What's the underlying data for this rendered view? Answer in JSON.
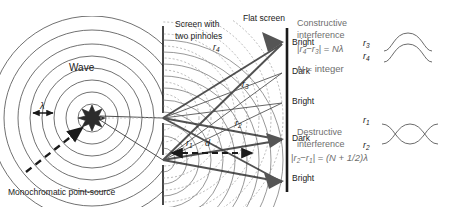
{
  "figure": {
    "type": "physics-diagram",
    "topic": "Young's double-slit (two-pinhole) interference",
    "background_color": "#ffffff",
    "ink_color": "#1a1a1a",
    "gray_color": "#6e6e6e"
  },
  "labels": {
    "screen_with_pinholes_line1": "Screen with",
    "screen_with_pinholes_line2": "two pinholes",
    "flat_screen": "Flat screen",
    "wave": "Wave",
    "source": "Monochromatic point-source",
    "wavelength_symbol": "λ",
    "slit_separation_symbol": "d"
  },
  "ray_labels": {
    "r4": "r",
    "r4_sub": "4",
    "r3": "r",
    "r3_sub": "3",
    "r2": "r",
    "r2_sub": "2",
    "r1": "r",
    "r1_sub": "1"
  },
  "fringes": [
    {
      "label": "Bright",
      "y": 44
    },
    {
      "label": "Dark",
      "y": 73
    },
    {
      "label": "Bright",
      "y": 103
    },
    {
      "label": "Dark",
      "y": 140
    },
    {
      "label": "Bright",
      "y": 180
    }
  ],
  "constructive": {
    "title_line1": "Constructive",
    "title_line2": "interference",
    "formula": "|r₄ − r₃| = Nλ",
    "formula_parts": {
      "bar_open": "|",
      "r_first": "r",
      "r_first_sub": "4",
      "minus": "−",
      "r_second": "r",
      "r_second_sub": "3",
      "bar_close": "|",
      "equals": "=",
      "rhs": "Nλ"
    },
    "note": "N = integer",
    "note_parts": {
      "n": "N",
      "eq": "=",
      "word": "integer"
    },
    "wave_top_label": "r",
    "wave_top_sub": "3",
    "wave_bottom_label": "r",
    "wave_bottom_sub": "4",
    "wave_relationship": "in-phase"
  },
  "destructive": {
    "title_line1": "Destructive",
    "title_line2": "interference",
    "formula": "|r₂ − r₁| = (N + 1/2)λ",
    "formula_parts": {
      "bar_open": "|",
      "r_first": "r",
      "r_first_sub": "2",
      "minus": "−",
      "r_second": "r",
      "r_second_sub": "1",
      "bar_close": "|",
      "equals": "=",
      "rhs": "(N + 1/2)λ"
    },
    "wave_top_label": "r",
    "wave_top_sub": "1",
    "wave_bottom_label": "r",
    "wave_bottom_sub": "2",
    "wave_relationship": "out-of-phase"
  },
  "geometry": {
    "source_x": 92,
    "source_y": 118,
    "barrier_x": 163,
    "detector_x": 287,
    "pinhole_upper_y": 118,
    "pinhole_lower_y": 160,
    "source_wavefront_radii": [
      14,
      26,
      38,
      50,
      62,
      74,
      86
    ],
    "pinhole_wavefront_radii": [
      10,
      20,
      30,
      40,
      50,
      60,
      70,
      80,
      90,
      100,
      110,
      120
    ]
  }
}
